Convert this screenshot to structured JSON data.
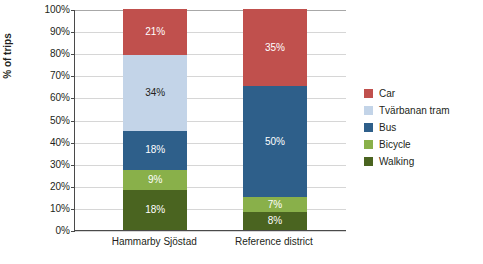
{
  "chart_data": {
    "type": "bar",
    "stacked": true,
    "title": "",
    "xlabel": "",
    "ylabel": "% of trips",
    "ylim": [
      0,
      100
    ],
    "ytick_labels": [
      "0%",
      "10%",
      "20%",
      "30%",
      "40%",
      "50%",
      "60%",
      "70%",
      "80%",
      "90%",
      "100%"
    ],
    "ytick_values": [
      0,
      10,
      20,
      30,
      40,
      50,
      60,
      70,
      80,
      90,
      100
    ],
    "grid": true,
    "legend_position": "right",
    "categories": [
      "Hammarby Sjöstad",
      "Reference district"
    ],
    "series": [
      {
        "name": "Walking",
        "color": "#4a6420",
        "values": [
          18,
          8
        ],
        "labels": [
          "18%",
          "8%"
        ],
        "label_color": "#ffffff"
      },
      {
        "name": "Bicycle",
        "color": "#89b04a",
        "values": [
          9,
          7
        ],
        "labels": [
          "9%",
          "7%"
        ],
        "label_color": "#ffffff"
      },
      {
        "name": "Bus",
        "color": "#2e5f8a",
        "values": [
          18,
          50
        ],
        "labels": [
          "18%",
          "50%"
        ],
        "label_color": "#ffffff"
      },
      {
        "name": "Tvärbanan tram",
        "color": "#c3d4e8",
        "values": [
          34,
          0
        ],
        "labels": [
          "34%",
          "0%"
        ],
        "label_color": "#231f20"
      },
      {
        "name": "Car",
        "color": "#c0504d",
        "values": [
          21,
          35
        ],
        "labels": [
          "21%",
          "35%"
        ],
        "label_color": "#ffffff"
      }
    ],
    "legend": [
      {
        "label": "Car",
        "color": "#c0504d"
      },
      {
        "label": "Tvärbanan tram",
        "color": "#c3d4e8"
      },
      {
        "label": "Bus",
        "color": "#2e5f8a"
      },
      {
        "label": "Bicycle",
        "color": "#89b04a"
      },
      {
        "label": "Walking",
        "color": "#4a6420"
      }
    ]
  }
}
